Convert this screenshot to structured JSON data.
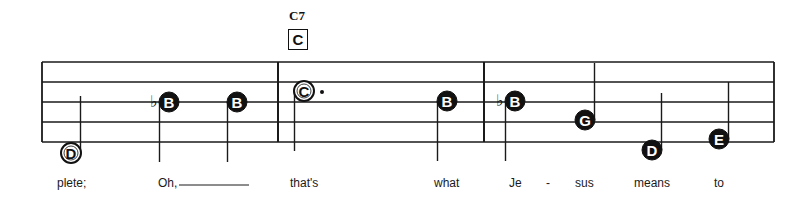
{
  "chord": {
    "name": "C7",
    "letter": "C"
  },
  "staff": {
    "lines_y": [
      62,
      82,
      102,
      122,
      142
    ],
    "left_x": 42,
    "right_x": 774,
    "barlines_x": [
      278,
      484
    ]
  },
  "notes": [
    {
      "letter": "D",
      "x": 71,
      "y": 153,
      "style": "half",
      "flat": false,
      "stem": "up",
      "dot": false
    },
    {
      "letter": "B",
      "x": 169,
      "y": 102,
      "style": "filled",
      "flat": true,
      "stem": "down",
      "dot": false
    },
    {
      "letter": "B",
      "x": 237,
      "y": 102,
      "style": "filled",
      "flat": false,
      "stem": "down",
      "dot": false
    },
    {
      "letter": "C",
      "x": 304,
      "y": 91,
      "style": "half",
      "flat": false,
      "stem": "down",
      "dot": true
    },
    {
      "letter": "B",
      "x": 447,
      "y": 101,
      "style": "filled",
      "flat": false,
      "stem": "down",
      "dot": false
    },
    {
      "letter": "B",
      "x": 515,
      "y": 101,
      "style": "filled",
      "flat": true,
      "stem": "down",
      "dot": false
    },
    {
      "letter": "G",
      "x": 585,
      "y": 120,
      "style": "filled",
      "flat": false,
      "stem": "up",
      "dot": false
    },
    {
      "letter": "D",
      "x": 652,
      "y": 150,
      "style": "filled",
      "flat": false,
      "stem": "up",
      "dot": false
    },
    {
      "letter": "E",
      "x": 719,
      "y": 139,
      "style": "filled",
      "flat": false,
      "stem": "up",
      "dot": false
    }
  ],
  "lyrics": [
    {
      "text": "plete;",
      "x": 57
    },
    {
      "text": "Oh,",
      "x": 158
    },
    {
      "text": "that's",
      "x": 290
    },
    {
      "text": "what",
      "x": 434
    },
    {
      "text": "Je",
      "x": 509
    },
    {
      "text": "-",
      "x": 546
    },
    {
      "text": "sus",
      "x": 575
    },
    {
      "text": "means",
      "x": 634
    },
    {
      "text": "to",
      "x": 714
    }
  ],
  "melisma_line": {
    "x1": 179,
    "x2": 249,
    "y": 185
  }
}
